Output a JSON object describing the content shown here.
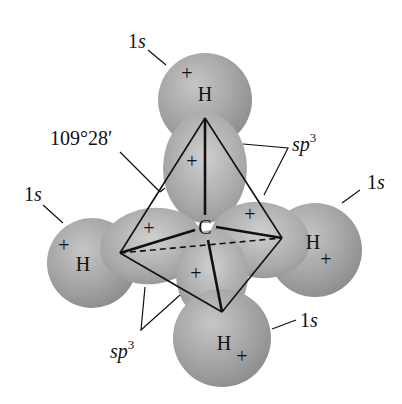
{
  "diagram": {
    "central_atom": "C",
    "hydrogens": [
      {
        "label": "H",
        "sign": "+",
        "orbital": "1s",
        "position": "top"
      },
      {
        "label": "H",
        "sign": "+",
        "orbital": "1s",
        "position": "left"
      },
      {
        "label": "H",
        "sign": "+",
        "orbital": "1s",
        "position": "right"
      },
      {
        "label": "H",
        "sign": "+",
        "orbital": "1s",
        "position": "bottom"
      }
    ],
    "hybrid_lobe_signs": [
      "+",
      "+",
      "+",
      "+"
    ],
    "labels": {
      "bond_angle": "109°28′",
      "orbital_1s": "1s",
      "orbital_1s_num": "1",
      "orbital_1s_letter": "s",
      "hybrid_sp": "sp",
      "hybrid_exp": "3",
      "plus": "+",
      "carbon": "C",
      "hydrogen": "H"
    },
    "colors": {
      "sphere": "#9a9a9a",
      "sphere_light": "#c4c4c4",
      "lobe": "#a8a8a8",
      "lines": "#111111",
      "background": "#ffffff"
    }
  }
}
